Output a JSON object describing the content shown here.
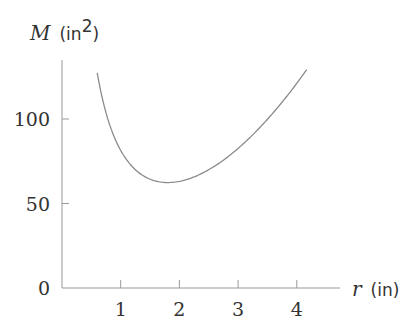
{
  "chart_data": {
    "type": "line",
    "title": "",
    "xlabel": "r (in)",
    "ylabel": "M (in²)",
    "x_axis": {
      "variable": "r",
      "unit": "(in)",
      "ticks": [
        1,
        2,
        3,
        4
      ],
      "range": [
        0,
        4.7
      ]
    },
    "y_axis": {
      "variable": "M",
      "unit": "(in",
      "unit_exp": "2",
      "unit_close": ")",
      "ticks": [
        0,
        50,
        100
      ],
      "range": [
        0,
        145
      ]
    },
    "origin_label": "0",
    "grid": false,
    "legend": null,
    "series": [
      {
        "name": "M(r)",
        "color": "#8a8a8a",
        "x": [
          0.6,
          0.8,
          1.0,
          1.2,
          1.4,
          1.6,
          1.8,
          2.0,
          2.2,
          2.4,
          2.6,
          2.8,
          3.0,
          3.2,
          3.4,
          3.6,
          3.8,
          4.0,
          4.17
        ],
        "y": [
          127.3,
          97.8,
          81.4,
          71.7,
          66.1,
          63.3,
          62.4,
          63.1,
          65.1,
          68.1,
          72.1,
          77.0,
          82.6,
          89.0,
          96.1,
          103.8,
          112.2,
          121.2,
          129.3
        ]
      }
    ]
  }
}
